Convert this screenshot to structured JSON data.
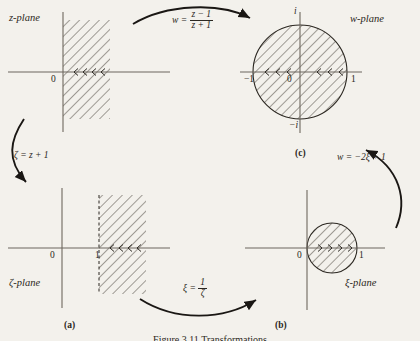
{
  "figure": {
    "caption": "Figure 3.11 Transformations",
    "background_color": "#f3f1ec",
    "ink_color": "#2b2721"
  },
  "panels": [
    {
      "id": "z-plane",
      "plane_label": "z-plane",
      "caption": "",
      "region_type": "half-strip-right-of-imaginary-axis",
      "axis_labels": {
        "origin": "0"
      },
      "hatched": true
    },
    {
      "id": "w-plane",
      "plane_label": "w-plane",
      "caption": "(c)",
      "region_type": "unit-disk",
      "axis_labels": {
        "origin": "0",
        "left": "−1",
        "right": "1",
        "top": "i",
        "bottom": "−i"
      },
      "hatched": true
    },
    {
      "id": "zeta-plane",
      "plane_label": "ζ-plane",
      "caption": "(a)",
      "region_type": "half-strip-right-of-one",
      "axis_labels": {
        "origin": "0",
        "one": "1"
      },
      "hatched": true
    },
    {
      "id": "xi-plane",
      "plane_label": "ξ-plane",
      "caption": "(b)",
      "region_type": "disk-centered-half",
      "axis_labels": {
        "origin": "0",
        "one": "1"
      },
      "hatched": true
    }
  ],
  "mappings": [
    {
      "id": "w-of-z",
      "kind": "fraction",
      "lhs": "w =",
      "numerator": "z − 1",
      "denominator": "z + 1",
      "from": "z-plane",
      "to": "w-plane"
    },
    {
      "id": "zeta-of-z",
      "kind": "inline",
      "text": "ζ = z + 1",
      "from": "z-plane",
      "to": "ζ-plane"
    },
    {
      "id": "xi-of-zeta",
      "kind": "fraction",
      "lhs": "ξ =",
      "numerator": "1",
      "denominator": "ζ",
      "from": "ζ-plane",
      "to": "ξ-plane"
    },
    {
      "id": "w-of-xi",
      "kind": "inline",
      "text": "w = −2ξ + 1",
      "from": "ξ-plane",
      "to": "w-plane"
    }
  ]
}
